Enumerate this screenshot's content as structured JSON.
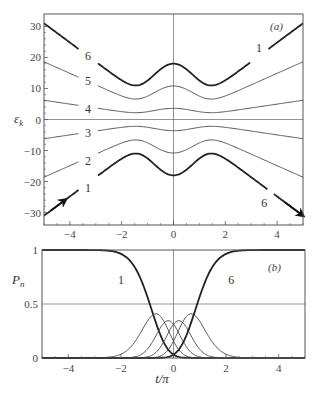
{
  "chart_data": [
    {
      "panel": "(a)",
      "type": "line",
      "title": "",
      "xlabel": "t/π",
      "ylabel": "ε_k",
      "xlim": [
        -5,
        5
      ],
      "ylim": [
        -34,
        34
      ],
      "xticks": [
        -4,
        -2,
        0,
        2,
        4
      ],
      "yticks": [
        -30,
        -20,
        -10,
        0,
        10,
        20,
        30
      ],
      "grid": false,
      "reference_lines": {
        "x": 0,
        "y": 0
      },
      "model": "eps_k(t) = (k - 3.5) * sqrt((2.48 t)^2 + (7.2 exp(-t^2/2))^2)",
      "series": [
        {
          "name": "6",
          "k": 6,
          "bold": true,
          "approx_points": {
            "t=-5": 31,
            "t=-1.4": 11,
            "t=0": 18,
            "t=1.4": 11,
            "t=5": 31
          }
        },
        {
          "name": "5",
          "k": 5,
          "bold": false,
          "approx_points": {
            "t=-5": 18.6,
            "t=-1.4": 6.6,
            "t=0": 10.8,
            "t=5": 18.6
          }
        },
        {
          "name": "4",
          "k": 4,
          "bold": false,
          "approx_points": {
            "t=-5": 6.2,
            "t=-1.4": 2.2,
            "t=0": 3.6,
            "t=5": 6.2
          }
        },
        {
          "name": "3",
          "k": 3,
          "bold": false,
          "approx_points": {
            "t=-5": -6.2,
            "t=-1.4": -2.2,
            "t=0": -3.6,
            "t=5": -6.2
          }
        },
        {
          "name": "2",
          "k": 2,
          "bold": false,
          "approx_points": {
            "t=-5": -18.6,
            "t=-1.4": -6.6,
            "t=0": -10.8,
            "t=5": -18.6
          }
        },
        {
          "name": "1",
          "k": 1,
          "bold": true,
          "approx_points": {
            "t=-5": -31,
            "t=-1.4": -11,
            "t=0": -18,
            "t=5": -31
          }
        }
      ],
      "curve_labels": [
        {
          "text": "6",
          "t": -3.3,
          "y": 20.5
        },
        {
          "text": "5",
          "t": -3.3,
          "y": 12.5
        },
        {
          "text": "4",
          "t": -3.3,
          "y": 3.5
        },
        {
          "text": "3",
          "t": -3.3,
          "y": -4.5
        },
        {
          "text": "2",
          "t": -3.3,
          "y": -13.5
        },
        {
          "text": "1",
          "t": -3.3,
          "y": -22
        },
        {
          "text": "1",
          "t": 3.3,
          "y": 23
        },
        {
          "text": "6",
          "t": 3.5,
          "y": -27
        }
      ],
      "annotations": [
        "arrow along curve 1 at t≈-4.3 (start)",
        "arrow along curve 6 at t≈4.8 (end)"
      ],
      "panel_tag": "(a)"
    },
    {
      "panel": "(b)",
      "type": "line",
      "title": "",
      "xlabel": "t/π",
      "ylabel": "P_n",
      "xlim": [
        -5,
        5
      ],
      "ylim": [
        0,
        1
      ],
      "xticks": [
        -4,
        -2,
        0,
        2,
        4
      ],
      "yticks": [
        0,
        0.5,
        1
      ],
      "ytick_labels": [
        "0",
        "0.5",
        "1"
      ],
      "grid": false,
      "reference_lines": {
        "x": 0,
        "y": 0.5
      },
      "model": "P_n = C(5,n-1) sin^(2(n-1))(θ/2) cos^(2(6-n))(θ/2), θ(t) = (π/2)(1+erf(t/1.76))",
      "series": [
        {
          "name": "1",
          "bold": true,
          "approx_points": {
            "t=-5": 1,
            "t=-2.5": 0.99,
            "t=-1.2": 0.5,
            "t=0": 0.03,
            "t=2": 0
          }
        },
        {
          "name": "2",
          "bold": false,
          "peak": {
            "t": -1.1,
            "P": 0.41
          }
        },
        {
          "name": "3",
          "bold": false,
          "peak": {
            "t": -0.4,
            "P": 0.31
          }
        },
        {
          "name": "4",
          "bold": false,
          "peak": {
            "t": 0.4,
            "P": 0.31
          }
        },
        {
          "name": "5",
          "bold": false,
          "peak": {
            "t": 1.1,
            "P": 0.41
          }
        },
        {
          "name": "6",
          "bold": true,
          "approx_points": {
            "t=-2": 0,
            "t=0": 0.03,
            "t=1.2": 0.5,
            "t=2.5": 0.99,
            "t=5": 1
          }
        }
      ],
      "curve_labels": [
        {
          "text": "1",
          "t": -2.0,
          "y": 0.72
        },
        {
          "text": "6",
          "t": 2.2,
          "y": 0.72
        }
      ],
      "panel_tag": "(b)"
    }
  ],
  "labels": {
    "panel_a_tag": "(a)",
    "panel_b_tag": "(b)",
    "ylabel_a": "ε",
    "ylabel_a_sub": "k",
    "ylabel_b": "P",
    "ylabel_b_sub": "n",
    "xlabel": "t/π"
  }
}
